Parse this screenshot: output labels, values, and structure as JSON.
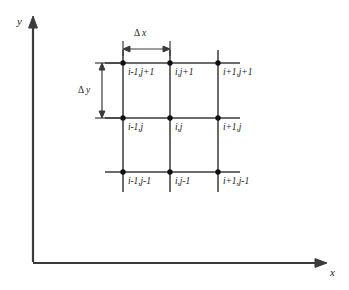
{
  "figure": {
    "kind": "finite-difference-grid-stencil",
    "colors": {
      "line": "#3a3a3a",
      "node": "#111111",
      "text": "#1a1a1a",
      "background": "#ffffff"
    },
    "axes": {
      "x_label": "x",
      "y_label": "y",
      "origin_x": 33,
      "origin_y": 263,
      "x_end": 327,
      "y_top": 18
    },
    "dimensions": {
      "dx": {
        "delta": "Δ",
        "var": "x"
      },
      "dy": {
        "delta": "Δ",
        "var": "y"
      }
    },
    "grid": {
      "columns": 3,
      "rows": 3,
      "col_x": [
        123,
        170,
        218
      ],
      "row_y": [
        63,
        118,
        172
      ],
      "h_line_start": 105,
      "h_line_end": 240,
      "v_line_start": 50,
      "v_line_end": 192,
      "node_radius": 2.6
    },
    "nodes": [
      {
        "label": "i-1,j+1",
        "col": 0,
        "row": 0
      },
      {
        "label": "i,j+1",
        "col": 1,
        "row": 0
      },
      {
        "label": "i+1,j+1",
        "col": 2,
        "row": 0
      },
      {
        "label": "i-1,j",
        "col": 0,
        "row": 1
      },
      {
        "label": "i,j",
        "col": 1,
        "row": 1
      },
      {
        "label": "i+1,j",
        "col": 2,
        "row": 1
      },
      {
        "label": "i-1,j-1",
        "col": 0,
        "row": 2
      },
      {
        "label": "i,j-1",
        "col": 1,
        "row": 2
      },
      {
        "label": "i+1,j-1",
        "col": 2,
        "row": 2
      }
    ]
  }
}
